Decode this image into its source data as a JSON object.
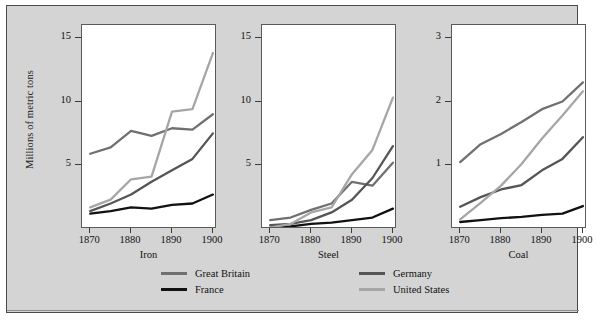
{
  "figure": {
    "ylabel": "Millions of metric tons",
    "background_color": "#d4d4d4",
    "plot_background_color": "#ffffff",
    "border_color": "#4a4a4a"
  },
  "legend": {
    "position": "bottom",
    "entries": [
      {
        "label": "Great Britain",
        "color": "#707070"
      },
      {
        "label": "France",
        "color": "#111111"
      },
      {
        "label": "Germany",
        "color": "#555555"
      },
      {
        "label": "United States",
        "color": "#a6a6a6"
      }
    ]
  },
  "chart_data": [
    {
      "type": "line",
      "title": "Iron",
      "xlabel": "Iron",
      "ylabel": "Millions of metric tons",
      "x": [
        1870,
        1875,
        1880,
        1885,
        1890,
        1895,
        1900
      ],
      "xlim": [
        1868,
        1901
      ],
      "ylim": [
        0,
        16
      ],
      "xticks": [
        1870,
        1880,
        1890,
        1900
      ],
      "xticklabels": [
        "1870",
        "1880",
        "1890",
        "1900"
      ],
      "yticks": [
        5,
        10,
        15
      ],
      "yticklabels": [
        "5",
        "10",
        "15"
      ],
      "grid": false,
      "series": [
        {
          "name": "Great Britain",
          "color": "#707070",
          "values": [
            5.9,
            6.4,
            7.7,
            7.3,
            7.9,
            7.8,
            9.0
          ]
        },
        {
          "name": "France",
          "color": "#111111",
          "values": [
            1.2,
            1.4,
            1.7,
            1.6,
            1.9,
            2.0,
            2.7
          ]
        },
        {
          "name": "Germany",
          "color": "#555555",
          "values": [
            1.4,
            2.0,
            2.7,
            3.7,
            4.6,
            5.5,
            7.5
          ]
        },
        {
          "name": "United States",
          "color": "#a6a6a6",
          "values": [
            1.7,
            2.3,
            3.9,
            4.1,
            9.2,
            9.4,
            13.8
          ]
        }
      ]
    },
    {
      "type": "line",
      "title": "Steel",
      "xlabel": "Steel",
      "ylabel": "Millions of metric tons",
      "x": [
        1870,
        1875,
        1880,
        1885,
        1890,
        1895,
        1900
      ],
      "xlim": [
        1868,
        1901
      ],
      "ylim": [
        0,
        16
      ],
      "xticks": [
        1870,
        1880,
        1890,
        1900
      ],
      "xticklabels": [
        "1870",
        "1880",
        "1890",
        "1900"
      ],
      "yticks": [
        5,
        10,
        15
      ],
      "yticklabels": [
        "5",
        "10",
        "15"
      ],
      "grid": false,
      "series": [
        {
          "name": "Great Britain",
          "color": "#707070",
          "values": [
            0.7,
            0.9,
            1.5,
            2.0,
            3.7,
            3.4,
            5.2
          ]
        },
        {
          "name": "France",
          "color": "#111111",
          "values": [
            0.1,
            0.2,
            0.4,
            0.5,
            0.7,
            0.9,
            1.6
          ]
        },
        {
          "name": "Germany",
          "color": "#555555",
          "values": [
            0.3,
            0.4,
            0.7,
            1.3,
            2.3,
            4.0,
            6.5
          ]
        },
        {
          "name": "United States",
          "color": "#a6a6a6",
          "values": [
            0.1,
            0.4,
            1.3,
            1.7,
            4.3,
            6.2,
            10.3
          ]
        }
      ]
    },
    {
      "type": "line",
      "title": "Coal",
      "xlabel": "Coal",
      "ylabel": "Millions of metric tons",
      "x": [
        1870,
        1875,
        1880,
        1885,
        1890,
        1895,
        1900
      ],
      "xlim": [
        1868,
        1901
      ],
      "ylim": [
        0,
        3.2
      ],
      "xticks": [
        1870,
        1880,
        1890,
        1900
      ],
      "xticklabels": [
        "1870",
        "1880",
        "1890",
        "1900"
      ],
      "yticks": [
        1,
        2,
        3
      ],
      "yticklabels": [
        "1",
        "2",
        "3"
      ],
      "grid": false,
      "series": [
        {
          "name": "Great Britain",
          "color": "#707070",
          "values": [
            1.05,
            1.33,
            1.49,
            1.68,
            1.88,
            2.0,
            2.3
          ]
        },
        {
          "name": "France",
          "color": "#111111",
          "values": [
            0.11,
            0.14,
            0.17,
            0.19,
            0.22,
            0.24,
            0.36
          ]
        },
        {
          "name": "Germany",
          "color": "#555555",
          "values": [
            0.35,
            0.5,
            0.62,
            0.69,
            0.92,
            1.1,
            1.44
          ]
        },
        {
          "name": "United States",
          "color": "#a6a6a6",
          "values": [
            0.15,
            0.41,
            0.68,
            1.02,
            1.42,
            1.78,
            2.16
          ]
        }
      ]
    }
  ]
}
